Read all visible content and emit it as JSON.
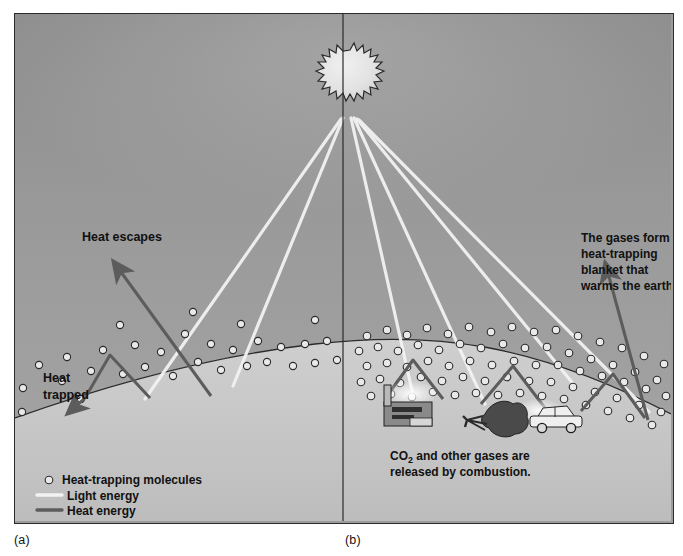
{
  "figure": {
    "panel_a_caption": "(a)",
    "panel_b_caption": "(b)",
    "colors": {
      "sky": "#9c9c9c",
      "sky_top": "#8f8f8f",
      "ground": "#c6c6c6",
      "light_energy": "#f2f2f2",
      "heat_energy": "#5c5c5c",
      "molecule_fill": "#e8e8e8",
      "molecule_stroke": "#2b2b2b",
      "sun_fill": "#e6e6e6",
      "outline": "#2b2b2b",
      "text": "#111111"
    }
  },
  "annotations": {
    "heat_escapes": "Heat escapes",
    "heat_trapped_line1": "Heat",
    "heat_trapped_line2": "trapped",
    "blanket_line1": "The gases form a",
    "blanket_line2": "heat-trapping",
    "blanket_line3": "blanket that",
    "blanket_line4": "warms the earth.",
    "combustion_line1_pre": "CO",
    "combustion_line1_sub": "2",
    "combustion_line1_post": " and other gases are",
    "combustion_line2": "released by combustion."
  },
  "legend": {
    "items": [
      {
        "label": "Heat-trapping molecules",
        "marker": "molecule-circle-icon"
      },
      {
        "label": "Light energy",
        "marker": "light-ray-icon"
      },
      {
        "label": "Heat energy",
        "marker": "heat-ray-icon"
      }
    ]
  },
  "scene_objects": {
    "sun": "sun-icon",
    "factory": "factory-icon",
    "tree": "burning-tree-icon",
    "car": "car-icon",
    "divider": "panel-divider"
  }
}
